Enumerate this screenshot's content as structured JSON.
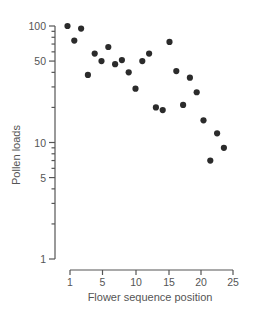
{
  "chart_data": {
    "type": "scatter",
    "title": "",
    "xlabel": "Flower sequence position",
    "ylabel": "Pollen loads",
    "x_scale": "linear",
    "y_scale": "log",
    "xlim": [
      1,
      25
    ],
    "ylim": [
      1,
      100
    ],
    "x_ticks": [
      1,
      5,
      10,
      15,
      20,
      25
    ],
    "x_tick_labels": [
      "1",
      "5",
      "10",
      "15",
      "20",
      "25"
    ],
    "y_ticks": [
      1,
      5,
      10,
      50,
      100
    ],
    "y_tick_labels": [
      "1",
      "5",
      "10",
      "50",
      "100"
    ],
    "y_minor_ticks": [
      2,
      3,
      4,
      6,
      7,
      8,
      9,
      20,
      30,
      40,
      60,
      70,
      80,
      90
    ],
    "grid": false,
    "legend": null,
    "x": [
      1,
      2,
      3,
      4,
      5,
      6,
      7,
      8,
      9,
      10,
      11,
      12,
      13,
      14,
      15,
      16,
      17,
      18,
      19,
      20,
      21,
      22,
      23,
      24
    ],
    "y": [
      100,
      75,
      95,
      38,
      58,
      50,
      66,
      47,
      51,
      40,
      29,
      50,
      58,
      20,
      19,
      73,
      41,
      21,
      36,
      27,
      15.5,
      7,
      12,
      9
    ],
    "marker_color": "#2b2b2b"
  }
}
